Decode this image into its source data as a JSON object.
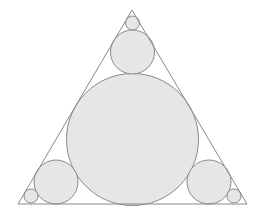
{
  "diagram": {
    "colors": {
      "stroke": "#8a8a8a",
      "fill": "#e6e6e6",
      "background": "#ffffff"
    },
    "triangle": {
      "points": [
        [
          132,
          10
        ],
        [
          18,
          204
        ],
        [
          247,
          204
        ]
      ]
    },
    "circles": [
      {
        "name": "incircle",
        "cx": 132.5,
        "cy": 139.5,
        "r": 66
      },
      {
        "name": "top-medium",
        "cx": 132.5,
        "cy": 52,
        "r": 22
      },
      {
        "name": "top-small",
        "cx": 132.5,
        "cy": 23,
        "r": 7
      },
      {
        "name": "left-medium",
        "cx": 56,
        "cy": 182,
        "r": 22
      },
      {
        "name": "left-small",
        "cx": 31,
        "cy": 196,
        "r": 7
      },
      {
        "name": "right-medium",
        "cx": 209,
        "cy": 182,
        "r": 22
      },
      {
        "name": "right-small",
        "cx": 234,
        "cy": 196,
        "r": 7
      }
    ]
  }
}
